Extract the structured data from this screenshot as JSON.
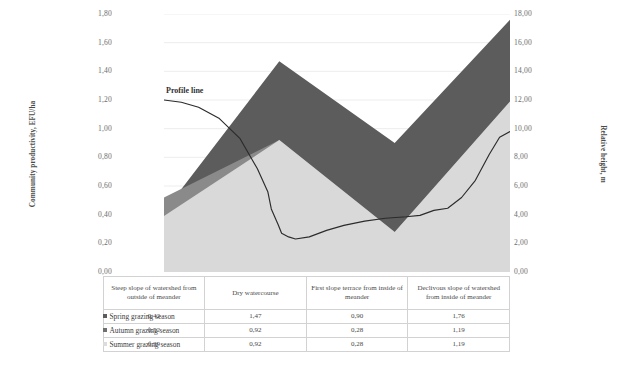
{
  "chart_data": {
    "type": "area",
    "title": "",
    "subtitle": "",
    "categories": [
      "Steep slope of watershed from outside of meander",
      "Dry watercourse",
      "First slope terrace from inside of meander",
      "Declivous slope of watershed from inside of meander"
    ],
    "series": [
      {
        "name": "Spring grazing season",
        "values": [
          0.42,
          1.47,
          0.9,
          1.76
        ],
        "color": "#5c5c5c"
      },
      {
        "name": "Autumn grazing season",
        "values": [
          0.52,
          0.92,
          0.28,
          1.19
        ],
        "color": "#8a8a8a"
      },
      {
        "name": "Summer grazing season",
        "values": [
          0.39,
          0.92,
          0.28,
          1.19
        ],
        "color": "#d9d9d9"
      }
    ],
    "profile_line": {
      "name": "Profile line",
      "label": "Profile line",
      "axis": "right",
      "color": "#2b2b2b",
      "x_fraction": [
        0.0,
        0.05,
        0.1,
        0.16,
        0.22,
        0.27,
        0.3,
        0.31,
        0.33,
        0.34,
        0.36,
        0.38,
        0.42,
        0.47,
        0.52,
        0.58,
        0.64,
        0.7,
        0.74,
        0.78,
        0.82,
        0.86,
        0.9,
        0.94,
        0.97,
        1.0
      ],
      "values_m": [
        12.0,
        11.85,
        11.5,
        10.7,
        9.3,
        7.2,
        5.6,
        4.4,
        3.3,
        2.7,
        2.45,
        2.3,
        2.45,
        2.9,
        3.25,
        3.55,
        3.75,
        3.85,
        3.95,
        4.3,
        4.45,
        5.2,
        6.4,
        8.2,
        9.4,
        9.8
      ]
    },
    "xlabel": "",
    "ylabel": "Community productivity, EFU/ha",
    "y2label": "Relative height, m",
    "ylim": [
      0,
      1.8
    ],
    "y2lim": [
      0,
      18
    ],
    "yticks": [
      "0,00",
      "0,20",
      "0,40",
      "0,60",
      "0,80",
      "1,00",
      "1,20",
      "1,40",
      "1,60",
      "1,80"
    ],
    "y2ticks": [
      "0,00",
      "2,00",
      "4,00",
      "6,00",
      "8,00",
      "10,00",
      "12,00",
      "14,00",
      "16,00",
      "18,00"
    ],
    "grid": true,
    "legend_position": "bottom-left-table",
    "table": {
      "columns": [
        "Steep slope of watershed from outside of meander",
        "Dry watercourse",
        "First slope terrace from inside of meander",
        "Declivous slope of watershed from inside of meander"
      ],
      "rows": [
        {
          "label": "Spring grazing season",
          "swatch": "#5c5c5c",
          "values": [
            "0,42",
            "1,47",
            "0,90",
            "1,76"
          ]
        },
        {
          "label": "Autumn grazing season",
          "swatch": "#6f6f6f",
          "values": [
            "0,52",
            "0,92",
            "0,28",
            "1,19"
          ]
        },
        {
          "label": "Summer grazing season",
          "swatch": "#dcdcdc",
          "values": [
            "0,39",
            "0,92",
            "0,28",
            "1,19"
          ]
        }
      ]
    }
  },
  "axes": {
    "left_title": "Community productivity, EFU/ha",
    "right_title": "Relative height, m"
  },
  "annotations": {
    "profile_line_label": "Profile line"
  }
}
